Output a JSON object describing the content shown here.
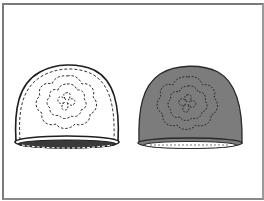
{
  "illustration": {
    "description": "Two beanie hats with flower stitching pattern",
    "hats": [
      {
        "id": "outline-hat",
        "fill": "#ffffff",
        "stroke": "#222222",
        "style": "outline"
      },
      {
        "id": "filled-hat",
        "fill": "#7c7c7c",
        "stroke": "#2a2a2a",
        "style": "filled"
      }
    ],
    "frame_color": "#7a7a7a"
  }
}
